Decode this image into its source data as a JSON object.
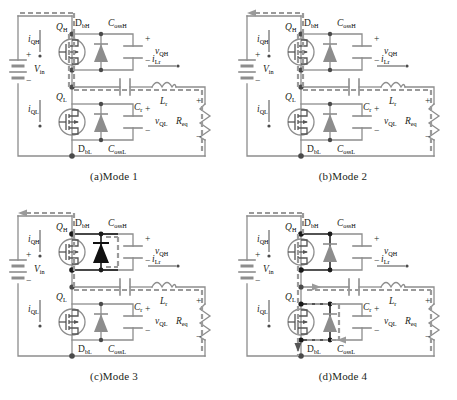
{
  "figure": {
    "panel_count": 4
  },
  "colors": {
    "wire": "#8d8d8d",
    "wire_dark": "#1a1a1a",
    "highlight": "#9a9a9a",
    "text": "#231f20",
    "device_fill": "#8d8d8d",
    "device_fill_dark": "#111111",
    "background": "#ffffff"
  },
  "labels": {
    "vin": "V",
    "vin_sub": "in",
    "qh": "Q",
    "qh_sub": "H",
    "ql": "Q",
    "ql_sub": "L",
    "iqh": "i",
    "iqh_sub": "QH",
    "iql": "i",
    "iql_sub": "QL",
    "dbh": "D",
    "dbh_sub": "bH",
    "dbl": "D",
    "dbl_sub": "bL",
    "cossh": "C",
    "cossh_sub": "ossH",
    "cossl": "C",
    "cossl_sub": "ossL",
    "vqh": "v",
    "vqh_sub": "QH",
    "vql": "v",
    "vql_sub": "QL",
    "cr": "C",
    "cr_sub": "r",
    "lr": "L",
    "lr_sub": "r",
    "ilr": "i",
    "ilr_sub": "Lr",
    "req": "R",
    "req_sub": "eq",
    "plus": "+",
    "minus": "−"
  },
  "panels": [
    {
      "id": "mode1",
      "caption_index": "(a)",
      "caption_text": "Mode 1",
      "highlight": {
        "top_rail": true,
        "top_rail_arrow": false,
        "mid_rail": true,
        "right_rail": true,
        "high_side_switch": true,
        "low_side_switch": false,
        "diode_high_dark": false,
        "diode_low_dark": false,
        "bottom_rail": false,
        "mid_arrow_left": false
      }
    },
    {
      "id": "mode2",
      "caption_index": "(b)",
      "caption_text": "Mode 2",
      "highlight": {
        "top_rail": true,
        "top_rail_arrow": true,
        "mid_rail": true,
        "right_rail": true,
        "high_side_switch": true,
        "low_side_switch": false,
        "diode_high_dark": false,
        "diode_low_dark": false,
        "bottom_rail": false,
        "mid_arrow_left": false
      }
    },
    {
      "id": "mode3",
      "caption_index": "(c)",
      "caption_text": "Mode 3",
      "highlight": {
        "top_rail": true,
        "top_rail_arrow": true,
        "mid_rail": true,
        "right_rail": true,
        "high_side_switch": true,
        "low_side_switch": false,
        "diode_high_dark": true,
        "diode_low_dark": false,
        "bottom_rail": false,
        "mid_arrow_left": false
      }
    },
    {
      "id": "mode4",
      "caption_index": "(d)",
      "caption_text": "Mode 4",
      "highlight": {
        "top_rail": true,
        "top_rail_arrow": false,
        "mid_rail": true,
        "right_rail": true,
        "high_side_switch": true,
        "low_side_switch": true,
        "diode_high_dark": false,
        "diode_low_dark": false,
        "bottom_rail": true,
        "mid_arrow_left": true
      }
    }
  ]
}
